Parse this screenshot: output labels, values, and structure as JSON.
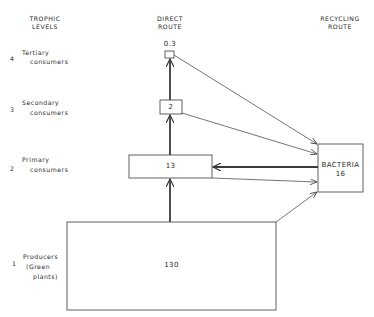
{
  "headers": {
    "trophic_levels": [
      "TROPHIC",
      "LEVELS"
    ],
    "direct_route": [
      "DIRECT",
      "ROUTE"
    ],
    "recycling_route": [
      "RECYCLING",
      "ROUTE"
    ]
  },
  "levels": [
    {
      "number": "4",
      "line1": "Tertiary",
      "line2": "consumers",
      "value": "0.3"
    },
    {
      "number": "3",
      "line1": "Secondary",
      "line2": "consumers",
      "value": "2"
    },
    {
      "number": "2",
      "line1": "Primary",
      "line2": "consumers",
      "value": "13"
    },
    {
      "number": "1",
      "line1": "Producers",
      "line2": "(Green",
      "line3": "plants)",
      "value": "130"
    }
  ],
  "bacteria": {
    "label": "BACTERIA",
    "value": "16"
  },
  "colors": {
    "line": "#3a3a3a",
    "background": "#ffffff"
  }
}
